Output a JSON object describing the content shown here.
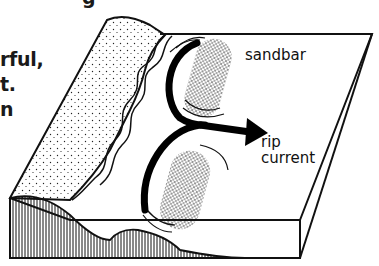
{
  "text_fragments": {
    "line0": "g",
    "line1": "rful,",
    "line2": "t.",
    "line3": "n"
  },
  "diagram": {
    "labels": {
      "sandbar": "sandbar",
      "rip": "rip",
      "current": "current"
    },
    "colors": {
      "ink": "#111111",
      "background": "#ffffff"
    }
  }
}
